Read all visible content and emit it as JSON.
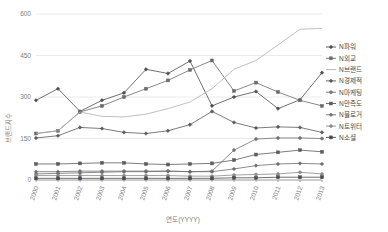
{
  "chart_data": {
    "type": "line",
    "title": "",
    "xlabel": "연도(YYYY)",
    "ylabel": "브랜드지수",
    "categories": [
      "2000",
      "2001",
      "2002",
      "2003",
      "2004",
      "2005",
      "2006",
      "2007",
      "2008",
      "2009",
      "2010",
      "2011",
      "2012",
      "2013"
    ],
    "ylim": [
      0,
      600
    ],
    "yticks": [
      0,
      150,
      300,
      450,
      600
    ],
    "grid": true,
    "legend_position": "right",
    "series": [
      {
        "name": "N파워",
        "color": "#4d4d4d",
        "marker": "diamond",
        "values": [
          288,
          330,
          248,
          288,
          315,
          400,
          385,
          430,
          268,
          300,
          320,
          258,
          290,
          388
        ]
      },
      {
        "name": "N외교",
        "color": "#6b6b6b",
        "marker": "square",
        "values": [
          168,
          178,
          246,
          268,
          300,
          330,
          360,
          398,
          432,
          322,
          352,
          318,
          288,
          268
        ]
      },
      {
        "name": "N브랜드",
        "color": "#b0b0b0",
        "marker": "none",
        "values": [
          168,
          178,
          246,
          230,
          228,
          238,
          258,
          282,
          330,
          400,
          432,
          488,
          545,
          548
        ]
      },
      {
        "name": "N경제적",
        "color": "#595959",
        "marker": "diamond",
        "values": [
          152,
          160,
          190,
          186,
          172,
          168,
          178,
          200,
          248,
          208,
          188,
          192,
          190,
          172
        ]
      },
      {
        "name": "N마케팅",
        "color": "#707070",
        "marker": "circle",
        "values": [
          22,
          24,
          26,
          28,
          30,
          30,
          32,
          30,
          32,
          108,
          148,
          152,
          152,
          150
        ]
      },
      {
        "name": "N만족도",
        "color": "#5c5c5c",
        "marker": "square",
        "values": [
          58,
          58,
          60,
          62,
          62,
          58,
          56,
          58,
          60,
          72,
          92,
          100,
          108,
          102
        ]
      },
      {
        "name": "N블로거",
        "color": "#6e6e6e",
        "marker": "diamond",
        "values": [
          30,
          30,
          32,
          32,
          32,
          32,
          32,
          30,
          30,
          40,
          52,
          58,
          60,
          58
        ]
      },
      {
        "name": "N트위터",
        "color": "#8a8a8a",
        "marker": "circle",
        "values": [
          16,
          16,
          16,
          16,
          16,
          16,
          16,
          14,
          14,
          18,
          20,
          22,
          28,
          22
        ]
      },
      {
        "name": "N소셜",
        "color": "#4a4a4a",
        "marker": "square",
        "values": [
          6,
          6,
          6,
          6,
          6,
          6,
          6,
          6,
          6,
          8,
          8,
          10,
          10,
          10
        ]
      }
    ]
  }
}
